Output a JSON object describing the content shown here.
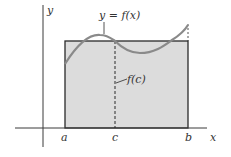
{
  "diagram": {
    "colors": {
      "rect_fill": "#dcdcdc",
      "rect_stroke": "#2a2a2a",
      "curve": "#8a8a8a",
      "axis": "#3a3a3a",
      "text": "#333333"
    },
    "labels": {
      "y_axis": "y",
      "x_axis": "x",
      "curve": "y = f(x)",
      "height": "f(c)",
      "a": "a",
      "c": "c",
      "b": "b"
    }
  }
}
